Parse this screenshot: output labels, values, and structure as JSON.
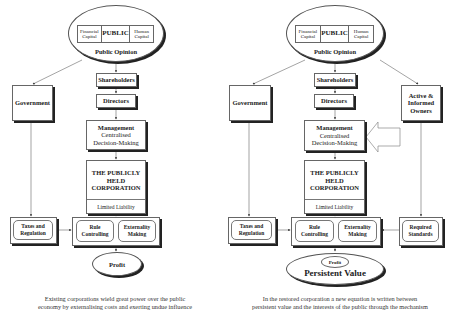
{
  "left": {
    "public": {
      "financial": "Financial Capital",
      "public": "PUBLIC",
      "human": "Human Capital",
      "opinion": "Public Opinion"
    },
    "government": "Government",
    "shareholders": "Shareholders",
    "directors": "Directors",
    "management": {
      "title": "Management",
      "line1": "Centralised",
      "line2": "Decision-Making"
    },
    "corporation": {
      "line1": "THE PUBLICLY",
      "line2": "HELD",
      "line3": "CORPORATION",
      "liability": "Limited Liability"
    },
    "taxes": {
      "line1": "Taxes and",
      "line2": "Regulation"
    },
    "rule": {
      "line1": "Rule",
      "line2": "Controlling"
    },
    "externality": {
      "line1": "Externality",
      "line2": "Making"
    },
    "profit": "Profit",
    "caption": {
      "line1": "Existing corporations wield great power over the public",
      "line2": "economy by externalising costs and exerting undue influence"
    }
  },
  "right": {
    "public": {
      "financial": "Financial Capital",
      "public": "PUBLIC",
      "human": "Human Capital",
      "opinion": "Public Opinion"
    },
    "government": "Government",
    "shareholders": "Shareholders",
    "directors": "Directors",
    "owners": {
      "line1": "Active &",
      "line2": "Informed",
      "line3": "Owners"
    },
    "management": {
      "title": "Management",
      "line1": "Centralised",
      "line2": "Decision-Making"
    },
    "corporation": {
      "line1": "THE PUBLICLY",
      "line2": "HELD",
      "line3": "CORPORATION",
      "liability": "Limited Liability"
    },
    "taxes": {
      "line1": "Taxes and",
      "line2": "Regulation"
    },
    "rule": {
      "line1": "Rule",
      "line2": "Controlling"
    },
    "externality": {
      "line1": "Externality",
      "line2": "Making"
    },
    "standards": {
      "line1": "Required",
      "line2": "Standards"
    },
    "profit": "Profit",
    "persistent": "Persistent Value",
    "caption": {
      "line1": "In the restored corporation a new equation is written between",
      "line2": "persistent value and the interests of the public through the mechanism"
    }
  }
}
